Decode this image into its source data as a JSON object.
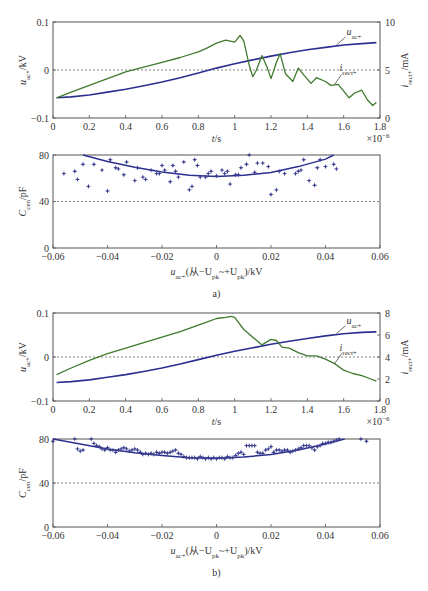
{
  "chart_data": [
    {
      "panel": "a-top",
      "type": "line",
      "xlabel": "t/s",
      "x_multiplier": "×10⁻⁶",
      "ylabel_left": "u_ac+/kV",
      "ylabel_right": "i_rect+/mA",
      "xlim": [
        0,
        1.8
      ],
      "ylim_left": [
        -0.1,
        0.1
      ],
      "ylim_right": [
        0,
        10
      ],
      "x_ticks": [
        "0",
        "0.2",
        "0.4",
        "0.6",
        "0.8",
        "1",
        "1.2",
        "1.4",
        "1.6",
        "1.8"
      ],
      "y_ticks_left": [
        "-0.1",
        "0",
        "0.1"
      ],
      "y_ticks_right": [
        "0",
        "5",
        "10"
      ],
      "reference_line_left": 0,
      "series": [
        {
          "name": "u_ac+",
          "axis": "left",
          "color": "#2b2f8f",
          "x": [
            0.02,
            0.1,
            0.2,
            0.3,
            0.4,
            0.5,
            0.6,
            0.7,
            0.8,
            0.9,
            1.0,
            1.1,
            1.2,
            1.3,
            1.4,
            1.5,
            1.6,
            1.7,
            1.78
          ],
          "y": [
            -0.058,
            -0.056,
            -0.052,
            -0.046,
            -0.04,
            -0.033,
            -0.025,
            -0.016,
            -0.006,
            0.004,
            0.013,
            0.021,
            0.029,
            0.036,
            0.042,
            0.047,
            0.052,
            0.055,
            0.057
          ]
        },
        {
          "name": "i_rect+",
          "axis": "right",
          "color": "#3f7a2e",
          "x": [
            0.02,
            0.1,
            0.2,
            0.3,
            0.4,
            0.5,
            0.6,
            0.7,
            0.8,
            0.85,
            0.9,
            0.95,
            1.0,
            1.03,
            1.05,
            1.08,
            1.1,
            1.12,
            1.15,
            1.18,
            1.2,
            1.23,
            1.25,
            1.28,
            1.32,
            1.35,
            1.38,
            1.42,
            1.45,
            1.5,
            1.53,
            1.57,
            1.6,
            1.63,
            1.66,
            1.7,
            1.73,
            1.76,
            1.78
          ],
          "y": [
            2.1,
            2.7,
            3.4,
            4.1,
            4.8,
            5.3,
            5.8,
            6.3,
            6.9,
            7.3,
            7.8,
            8.1,
            7.9,
            8.6,
            8.0,
            5.5,
            4.3,
            5.0,
            6.5,
            5.2,
            4.1,
            5.8,
            6.7,
            4.6,
            3.8,
            5.2,
            4.5,
            3.6,
            4.2,
            3.8,
            3.4,
            3.5,
            2.8,
            2.1,
            2.6,
            2.9,
            1.9,
            1.3,
            1.6
          ]
        }
      ],
      "annotations": [
        "u_ac+",
        "i_rect+"
      ]
    },
    {
      "panel": "a-bottom",
      "type": "scatter",
      "xlabel": "u_ac+(从-U_pk~+U_pk)/kV",
      "ylabel": "C_cen/pF",
      "xlim": [
        -0.06,
        0.06
      ],
      "ylim": [
        0,
        80
      ],
      "x_ticks": [
        "-0.06",
        "-0.04",
        "-0.02",
        "0",
        "0.02",
        "0.04",
        "0.06"
      ],
      "y_ticks": [
        "0",
        "40",
        "80"
      ],
      "reference_line": 40,
      "series": [
        {
          "name": "measured",
          "marker": "star",
          "color": "#3b3f8f",
          "x": [
            -0.056,
            -0.052,
            -0.051,
            -0.049,
            -0.047,
            -0.045,
            -0.042,
            -0.04,
            -0.039,
            -0.037,
            -0.036,
            -0.034,
            -0.033,
            -0.03,
            -0.029,
            -0.027,
            -0.026,
            -0.024,
            -0.022,
            -0.021,
            -0.02,
            -0.019,
            -0.017,
            -0.016,
            -0.015,
            -0.014,
            -0.012,
            -0.01,
            -0.009,
            -0.008,
            -0.007,
            -0.006,
            -0.004,
            -0.003,
            -0.002,
            0.0,
            0.002,
            0.003,
            0.004,
            0.005,
            0.007,
            0.008,
            0.009,
            0.011,
            0.012,
            0.014,
            0.015,
            0.017,
            0.019,
            0.02,
            0.022,
            0.023,
            0.025,
            0.029,
            0.03,
            0.031,
            0.032,
            0.034,
            0.036,
            0.037,
            0.038,
            0.04,
            0.043,
            0.044
          ],
          "y": [
            64,
            66,
            59,
            72,
            53,
            72,
            67,
            49,
            76,
            69,
            68,
            63,
            74,
            58,
            69,
            61,
            59,
            67,
            64,
            64,
            71,
            67,
            57,
            71,
            66,
            61,
            74,
            50,
            53,
            76,
            71,
            61,
            61,
            64,
            66,
            62,
            67,
            64,
            66,
            55,
            63,
            63,
            69,
            72,
            80,
            65,
            73,
            73,
            70,
            46,
            50,
            66,
            64,
            64,
            66,
            67,
            76,
            58,
            54,
            69,
            76,
            70,
            72,
            68
          ]
        },
        {
          "name": "fit",
          "type": "line",
          "color": "#2b2f8f",
          "x": [
            -0.049,
            -0.04,
            -0.03,
            -0.02,
            -0.01,
            0.0,
            0.01,
            0.02,
            0.03,
            0.04,
            0.043
          ],
          "y": [
            80,
            74.5,
            69.5,
            65.5,
            62.5,
            61.5,
            62.5,
            65,
            70,
            76.5,
            80
          ]
        }
      ]
    },
    {
      "panel": "b-top",
      "type": "line",
      "xlabel": "t/s",
      "x_multiplier": "×10⁻⁶",
      "ylabel_left": "u_ac+/kV",
      "ylabel_right": "i_rect+/mA",
      "xlim": [
        0,
        1.8
      ],
      "ylim_left": [
        -0.1,
        0.1
      ],
      "ylim_right": [
        0,
        8
      ],
      "x_ticks": [
        "0",
        "0.2",
        "0.4",
        "0.6",
        "0.8",
        "1",
        "1.2",
        "1.4",
        "1.6",
        "1.8"
      ],
      "y_ticks_left": [
        "-0.1",
        "0",
        "0.1"
      ],
      "y_ticks_right": [
        "0",
        "2",
        "4",
        "6",
        "8"
      ],
      "reference_line_left": 0,
      "series": [
        {
          "name": "u_ac+",
          "axis": "left",
          "color": "#2b2f8f",
          "x": [
            0.02,
            0.1,
            0.2,
            0.3,
            0.4,
            0.5,
            0.6,
            0.7,
            0.8,
            0.9,
            1.0,
            1.1,
            1.2,
            1.3,
            1.4,
            1.5,
            1.6,
            1.7,
            1.78
          ],
          "y": [
            -0.058,
            -0.056,
            -0.052,
            -0.046,
            -0.04,
            -0.033,
            -0.025,
            -0.016,
            -0.006,
            0.004,
            0.013,
            0.021,
            0.029,
            0.036,
            0.042,
            0.048,
            0.053,
            0.056,
            0.057
          ]
        },
        {
          "name": "i_rect+",
          "axis": "right",
          "color": "#3f7a2e",
          "x": [
            0.02,
            0.1,
            0.2,
            0.3,
            0.4,
            0.5,
            0.6,
            0.7,
            0.8,
            0.85,
            0.9,
            0.95,
            0.98,
            1.0,
            1.05,
            1.1,
            1.15,
            1.2,
            1.23,
            1.26,
            1.3,
            1.35,
            1.4,
            1.45,
            1.5,
            1.55,
            1.6,
            1.65,
            1.7,
            1.75,
            1.78
          ],
          "y": [
            2.4,
            3.0,
            3.7,
            4.3,
            4.8,
            5.3,
            5.8,
            6.3,
            6.9,
            7.2,
            7.5,
            7.6,
            7.7,
            7.6,
            6.5,
            5.8,
            5.1,
            5.6,
            5.5,
            4.9,
            4.8,
            4.4,
            4.1,
            4.1,
            3.8,
            3.4,
            2.8,
            2.5,
            2.3,
            2.0,
            1.8
          ]
        }
      ],
      "annotations": [
        "u_ac+",
        "i_rect+"
      ]
    },
    {
      "panel": "b-bottom",
      "type": "scatter",
      "xlabel": "u_ac+(从-U_pk~+U_pk)/kV",
      "ylabel": "C_cen/pF",
      "xlim": [
        -0.06,
        0.06
      ],
      "ylim": [
        0,
        80
      ],
      "x_ticks": [
        "-0.06",
        "-0.04",
        "-0.02",
        "0",
        "0.02",
        "0.04",
        "0.06"
      ],
      "y_ticks": [
        "0",
        "40",
        "80"
      ],
      "reference_line": 40,
      "series": [
        {
          "name": "measured",
          "marker": "star",
          "color": "#3b3f8f",
          "x": [
            -0.06,
            -0.052,
            -0.051,
            -0.05,
            -0.049,
            -0.046,
            -0.045,
            -0.044,
            -0.043,
            -0.042,
            -0.041,
            -0.04,
            -0.039,
            -0.038,
            -0.037,
            -0.036,
            -0.035,
            -0.034,
            -0.033,
            -0.032,
            -0.031,
            -0.03,
            -0.029,
            -0.028,
            -0.027,
            -0.026,
            -0.025,
            -0.024,
            -0.023,
            -0.022,
            -0.021,
            -0.02,
            -0.019,
            -0.018,
            -0.017,
            -0.016,
            -0.015,
            -0.014,
            -0.013,
            -0.012,
            -0.011,
            -0.01,
            -0.009,
            -0.008,
            -0.007,
            -0.006,
            -0.005,
            -0.004,
            -0.003,
            -0.002,
            -0.001,
            0.0,
            0.001,
            0.002,
            0.003,
            0.004,
            0.005,
            0.006,
            0.007,
            0.008,
            0.009,
            0.01,
            0.011,
            0.012,
            0.013,
            0.014,
            0.015,
            0.016,
            0.017,
            0.018,
            0.019,
            0.02,
            0.021,
            0.022,
            0.023,
            0.024,
            0.025,
            0.026,
            0.027,
            0.028,
            0.029,
            0.03,
            0.031,
            0.032,
            0.033,
            0.034,
            0.035,
            0.036,
            0.037,
            0.038,
            0.039,
            0.04,
            0.041,
            0.042,
            0.043,
            0.044,
            0.045,
            0.053,
            0.055
          ],
          "y": [
            78,
            80,
            71,
            69,
            70,
            80,
            76,
            74,
            73,
            71,
            70,
            72,
            70,
            70,
            68,
            70,
            71,
            72,
            71,
            69,
            70,
            71,
            70,
            68,
            66,
            67,
            66,
            67,
            66,
            68,
            67,
            68,
            68,
            67,
            68,
            69,
            70,
            67,
            66,
            64,
            63,
            63,
            63,
            63,
            62,
            64,
            63,
            62,
            63,
            62,
            63,
            62,
            63,
            63,
            62,
            64,
            63,
            63,
            65,
            67,
            68,
            66,
            74,
            74,
            74,
            74,
            68,
            67,
            67,
            70,
            71,
            73,
            68,
            70,
            70,
            69,
            70,
            70,
            68,
            69,
            70,
            71,
            72,
            74,
            74,
            74,
            72,
            70,
            73,
            74,
            76,
            76,
            77,
            77,
            78,
            79,
            80,
            80,
            78
          ]
        },
        {
          "name": "fit",
          "type": "line",
          "color": "#2b2f8f",
          "x": [
            -0.06,
            -0.05,
            -0.04,
            -0.03,
            -0.02,
            -0.01,
            0.0,
            0.01,
            0.02,
            0.03,
            0.04,
            0.047
          ],
          "y": [
            80,
            75.5,
            71,
            67.5,
            65,
            63,
            62.5,
            63.5,
            66,
            70,
            75.5,
            80
          ]
        }
      ]
    }
  ],
  "text": {
    "a_top_ylabel_left": "u",
    "a_top_ylabel_left_sub": "ac+",
    "a_top_ylabel_left_unit": "/kV",
    "a_top_ylabel_right": "i",
    "a_top_ylabel_right_sub": "rect+",
    "a_top_ylabel_right_unit": "/mA",
    "a_top_xlabel": "t/s",
    "a_top_multiplier": "×10",
    "a_top_multiplier_exp": "−6",
    "label_u": "u",
    "label_u_sub": "ac+",
    "label_i": "i",
    "label_i_sub": "rect+",
    "cen_ylabel": "C",
    "cen_ylabel_sub": "cen",
    "cen_ylabel_unit": "/pF",
    "cen_xlabel_u": "u",
    "cen_xlabel_u_sub": "ac+",
    "cen_xlabel_mid": "(从−U",
    "cen_xlabel_pk1": "pk",
    "cen_xlabel_mid2": "~+U",
    "cen_xlabel_pk2": "pk",
    "cen_xlabel_end": ")/kV",
    "caption_a": "a)",
    "caption_b": "b)"
  }
}
